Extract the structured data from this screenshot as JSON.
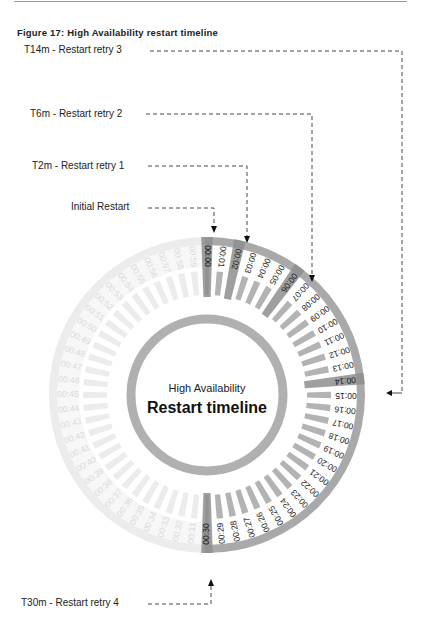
{
  "figure": {
    "title": "Figure 17: High Availability restart timeline"
  },
  "center": {
    "subtitle": "High Availability",
    "title": "Restart timeline"
  },
  "callouts": [
    {
      "id": "t14",
      "label": "T14m - Restart retry 3",
      "minute": 14
    },
    {
      "id": "t6",
      "label": "T6m - Restart retry 2",
      "minute": 6
    },
    {
      "id": "t2",
      "label": "T2m - Restart retry 1",
      "minute": 2
    },
    {
      "id": "t0",
      "label": "Initial Restart",
      "minute": 0
    },
    {
      "id": "t30",
      "label": "T30m - Restart retry 4",
      "minute": 30
    }
  ],
  "timeline": {
    "total_minutes": 60,
    "active_range": [
      0,
      30
    ],
    "highlighted_minutes": [
      0,
      2,
      6,
      14,
      30
    ],
    "tick_labels": [
      "00:00",
      "00:01",
      "00:02",
      "00:03",
      "00:04",
      "00:05",
      "00:06",
      "00:07",
      "00:08",
      "00:09",
      "00:10",
      "00:11",
      "00:12",
      "00:13",
      "00:14",
      "00:15",
      "00:16",
      "00:17",
      "00:18",
      "00:19",
      "00:20",
      "00:21",
      "00:22",
      "00:23",
      "00:24",
      "00:25",
      "00:26",
      "00:27",
      "00:28",
      "00:29",
      "00:30",
      "00:31",
      "00:32",
      "00:33",
      "00:34",
      "00:35",
      "00:36",
      "00:37",
      "00:38",
      "00:39",
      "00:40",
      "00:41",
      "00:42",
      "00:43",
      "00:44",
      "00:45",
      "00:46",
      "00:47",
      "00:48",
      "00:49",
      "00:50",
      "00:51",
      "00:52",
      "00:53",
      "00:54",
      "00:55",
      "00:56",
      "00:57",
      "00:58",
      "00:59"
    ]
  },
  "colors": {
    "band": "#a9a9a9",
    "highlight": "#8e8e8e",
    "tick": "#b3b3b3",
    "faded": "#ececec",
    "inner_ring": "#b0b0b0",
    "text": "#1a1a1a",
    "faded_text": "#d9d9d9",
    "dash": "#333333"
  }
}
